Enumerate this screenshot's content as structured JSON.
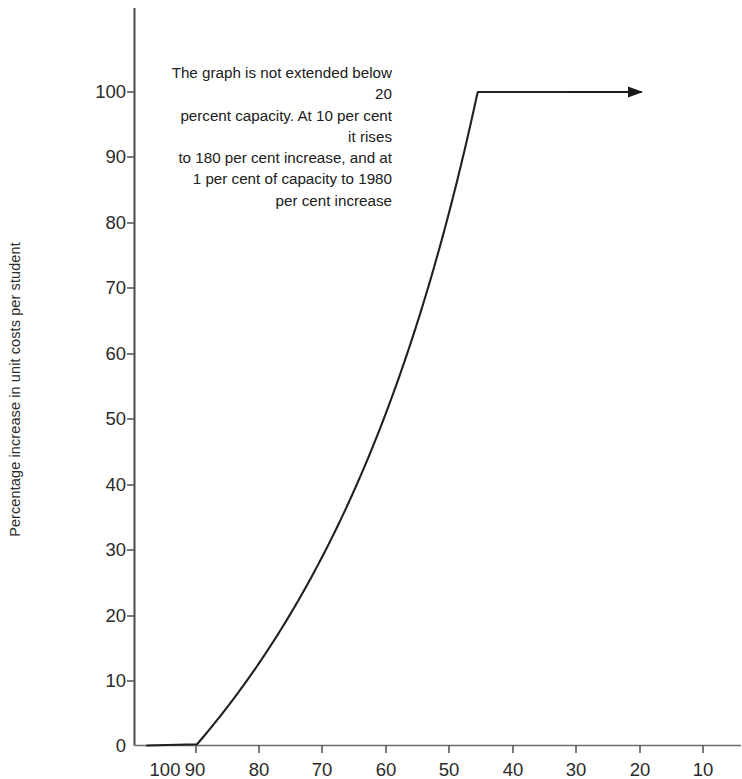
{
  "chart_data": {
    "type": "line",
    "title": "",
    "xlabel": "",
    "ylabel": "Percentage increase in unit costs per student",
    "xlim": [
      100,
      5
    ],
    "ylim": [
      0,
      108
    ],
    "x_ticks": [
      100,
      90,
      80,
      70,
      60,
      50,
      40,
      30,
      20,
      10
    ],
    "y_ticks": [
      0,
      10,
      20,
      30,
      40,
      50,
      60,
      70,
      80,
      90,
      100
    ],
    "grid": false,
    "legend": null,
    "x_axis_reversed": true,
    "series": [
      {
        "name": "Percentage increase in unit costs per student",
        "color": "#231f20",
        "x": [
          100,
          95,
          90,
          85,
          80,
          75,
          70,
          65,
          60,
          55,
          50,
          45,
          40,
          35,
          30,
          25,
          22,
          21,
          20
        ],
        "values": [
          0.0,
          5.3,
          11.1,
          17.6,
          25.0,
          33.3,
          42.9,
          53.8,
          66.7,
          81.8,
          100.0,
          122.2,
          150.0,
          185.7,
          233.3,
          300.0,
          354.5,
          376.2,
          400.0
        ],
        "plotted_x_range": [
          100,
          21
        ],
        "plotted_y_range": [
          0,
          100
        ],
        "formula": "increase = 100 * (100 / capacity - 1)"
      }
    ],
    "annotations": [
      {
        "name": "curve-note",
        "text": "The graph is not extended below 20\npercent capacity. At 10 per cent it rises\nto 180 per cent increase, and at\n1 per cent of capacity to 1980\nper cent increase",
        "align": "right",
        "arrow": {
          "from_x_px": 568,
          "to_x_px": 643,
          "y_px": 92,
          "points_to": "curve top at 100 per cent increase"
        }
      }
    ],
    "reference_values": [
      {
        "capacity": 20,
        "increase": 400
      },
      {
        "capacity": 10,
        "increase": 180
      },
      {
        "capacity": 1,
        "increase": 1980
      }
    ]
  },
  "axis": {
    "y_title": "Percentage increase in unit costs per student",
    "y_tick_labels": [
      "100",
      "90",
      "80",
      "70",
      "60",
      "50",
      "40",
      "30",
      "20",
      "10",
      "0"
    ],
    "x_tick_labels": [
      "100",
      "90",
      "80",
      "70",
      "60",
      "50",
      "40",
      "30",
      "20",
      "10"
    ]
  },
  "annotation": {
    "line1": "The graph is not extended below 20",
    "line2": "percent capacity. At 10 per cent it rises",
    "line3": "to 180 per cent increase, and at",
    "line4": "1 per cent of capacity to 1980",
    "line5": "per cent increase",
    "full": "The graph is not extended below 20\npercent capacity. At 10 per cent it rises\nto 180 per cent increase, and at\n1 per cent of capacity to 1980\nper cent increase"
  },
  "colors": {
    "curve": "#231f20",
    "axis": "#4a4a4a",
    "text": "#2b2b2b",
    "background": "#ffffff"
  }
}
